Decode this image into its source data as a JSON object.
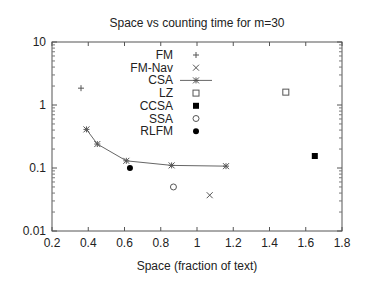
{
  "chart_data": {
    "type": "scatter",
    "title": "Space vs counting time for m=30",
    "xlabel": "Space (fraction of text)",
    "ylabel": "",
    "xlim": [
      0.2,
      1.8
    ],
    "ylim": [
      0.01,
      10
    ],
    "yscale": "log",
    "xticks": [
      "0.2",
      "0.4",
      "0.6",
      "0.8",
      "1",
      "1.2",
      "1.4",
      "1.6",
      "1.8"
    ],
    "yticks": [
      "0.01",
      "0.1",
      "1",
      "10"
    ],
    "grid": false,
    "legend_position": "upper-center",
    "series": [
      {
        "name": "FM",
        "marker": "plus",
        "points": [
          [
            0.36,
            1.85
          ]
        ]
      },
      {
        "name": "FM-Nav",
        "marker": "cross",
        "points": [
          [
            1.07,
            0.037
          ]
        ]
      },
      {
        "name": "CSA",
        "marker": "star-line",
        "points": [
          [
            0.39,
            0.41
          ],
          [
            0.45,
            0.24
          ],
          [
            0.61,
            0.13
          ],
          [
            0.86,
            0.11
          ],
          [
            1.16,
            0.107
          ]
        ]
      },
      {
        "name": "LZ",
        "marker": "open-square",
        "points": [
          [
            1.49,
            1.6
          ]
        ]
      },
      {
        "name": "CCSA",
        "marker": "filled-square",
        "points": [
          [
            1.65,
            0.155
          ]
        ]
      },
      {
        "name": "SSA",
        "marker": "open-circle",
        "points": [
          [
            0.87,
            0.05
          ]
        ]
      },
      {
        "name": "RLFM",
        "marker": "filled-circle",
        "points": [
          [
            0.63,
            0.1
          ]
        ]
      }
    ]
  }
}
